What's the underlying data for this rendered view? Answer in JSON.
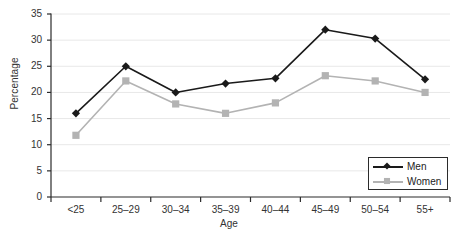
{
  "chart_data": {
    "type": "line",
    "title": "",
    "xlabel": "Age",
    "ylabel": "Percentage",
    "categories": [
      "<25",
      "25–29",
      "30–34",
      "35–39",
      "40–44",
      "45–49",
      "50–54",
      "55+"
    ],
    "series": [
      {
        "name": "Men",
        "color": "#1a1a1a",
        "marker": "diamond",
        "values": [
          16,
          25,
          20,
          21.7,
          22.7,
          32,
          30.3,
          22.5
        ]
      },
      {
        "name": "Women",
        "color": "#b3b3b3",
        "marker": "square",
        "values": [
          11.8,
          22.2,
          17.8,
          16,
          18,
          23.2,
          22.2,
          20
        ]
      }
    ],
    "ylim": [
      0,
      35
    ],
    "yticks": [
      0,
      5,
      10,
      15,
      20,
      25,
      30,
      35
    ],
    "ytick_labels": [
      "0",
      "5",
      "10",
      "15",
      "20",
      "25",
      "30",
      "35"
    ],
    "grid": true,
    "grid_color": "#e8e8e8",
    "axis_color": "#2b2b2b",
    "legend_position": "bottom-right"
  }
}
